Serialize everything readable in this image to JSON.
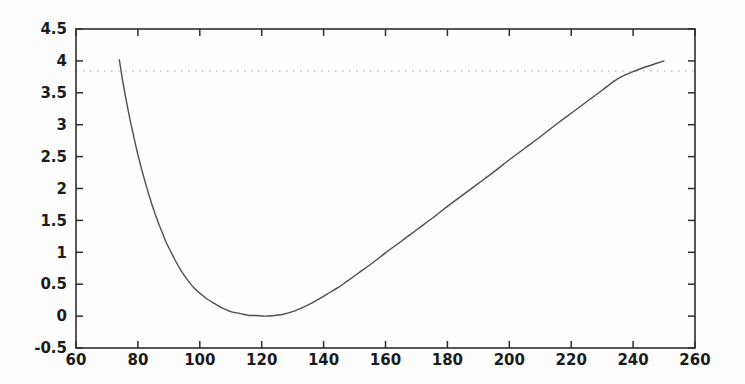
{
  "figure": {
    "background": "#fdfdfd",
    "axis_color": "#2e2e2e",
    "curve_color": "#4f4f4f",
    "threshold_color": "#c2c2c2",
    "label_color": "#1b1b1b"
  },
  "chart_data": {
    "type": "line",
    "title": "",
    "xlabel": "",
    "ylabel": "",
    "xlim": [
      60,
      260
    ],
    "ylim": [
      -0.5,
      4.5
    ],
    "grid": false,
    "box": true,
    "tick_direction": "in",
    "x_ticks": [
      60,
      80,
      100,
      120,
      140,
      160,
      180,
      200,
      220,
      240,
      260
    ],
    "x_tick_labels": [
      "60",
      "80",
      "100",
      "120",
      "140",
      "160",
      "180",
      "200",
      "220",
      "240",
      "260"
    ],
    "y_ticks": [
      -0.5,
      0,
      0.5,
      1,
      1.5,
      2,
      2.5,
      3,
      3.5,
      4,
      4.5
    ],
    "y_tick_labels": [
      "-0.5",
      "0",
      "0.5",
      "1",
      "1.5",
      "2",
      "2.5",
      "3",
      "3.5",
      "4",
      "4.5"
    ],
    "reference_lines": [
      {
        "name": "chi-square-95-threshold",
        "orientation": "horizontal",
        "y": 3.84,
        "style": "dotted"
      }
    ],
    "series": [
      {
        "name": "profile-likelihood-curve",
        "style": "solid",
        "minimum": [
          121,
          0
        ],
        "points": [
          [
            74,
            4.02
          ],
          [
            75,
            3.71
          ],
          [
            76,
            3.44
          ],
          [
            77,
            3.19
          ],
          [
            78,
            2.96
          ],
          [
            79,
            2.74
          ],
          [
            80,
            2.53
          ],
          [
            81,
            2.34
          ],
          [
            82,
            2.16
          ],
          [
            83,
            1.99
          ],
          [
            84,
            1.83
          ],
          [
            85,
            1.68
          ],
          [
            86,
            1.54
          ],
          [
            87,
            1.41
          ],
          [
            88,
            1.29
          ],
          [
            89,
            1.17
          ],
          [
            90,
            1.07
          ],
          [
            92,
            0.88
          ],
          [
            94,
            0.71
          ],
          [
            96,
            0.57
          ],
          [
            98,
            0.45
          ],
          [
            100,
            0.36
          ],
          [
            102,
            0.28
          ],
          [
            104,
            0.22
          ],
          [
            106,
            0.16
          ],
          [
            108,
            0.11
          ],
          [
            110,
            0.07
          ],
          [
            112,
            0.05
          ],
          [
            114,
            0.03
          ],
          [
            116,
            0.01
          ],
          [
            118,
            0.01
          ],
          [
            121,
            0.0
          ],
          [
            124,
            0.01
          ],
          [
            127,
            0.03
          ],
          [
            130,
            0.07
          ],
          [
            133,
            0.13
          ],
          [
            136,
            0.2
          ],
          [
            139,
            0.28
          ],
          [
            142,
            0.37
          ],
          [
            145,
            0.46
          ],
          [
            148,
            0.56
          ],
          [
            152,
            0.7
          ],
          [
            156,
            0.84
          ],
          [
            160,
            0.99
          ],
          [
            165,
            1.17
          ],
          [
            170,
            1.35
          ],
          [
            175,
            1.53
          ],
          [
            180,
            1.72
          ],
          [
            185,
            1.9
          ],
          [
            190,
            2.08
          ],
          [
            195,
            2.26
          ],
          [
            200,
            2.45
          ],
          [
            205,
            2.63
          ],
          [
            210,
            2.81
          ],
          [
            215,
            3.0
          ],
          [
            220,
            3.18
          ],
          [
            225,
            3.36
          ],
          [
            230,
            3.54
          ],
          [
            235,
            3.72
          ],
          [
            240,
            3.83
          ],
          [
            245,
            3.92
          ],
          [
            250,
            4.0
          ]
        ]
      }
    ],
    "layout": {
      "width": 745,
      "height": 384,
      "plot_left": 76,
      "plot_top": 29,
      "plot_right": 695,
      "plot_bottom": 348,
      "tick_length": 7
    }
  }
}
